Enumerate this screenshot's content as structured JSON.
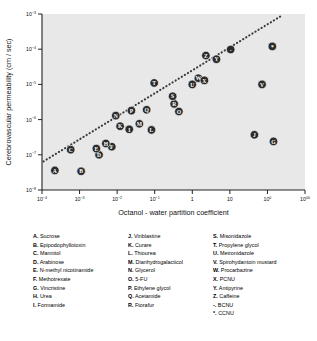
{
  "chart_data": {
    "type": "scatter",
    "title": "",
    "xlabel": "Octanol - water partition coefficient",
    "ylabel": "Cerebrovascular permeability  (cm / sec)",
    "xscale": "log",
    "yscale": "log",
    "xlim": [
      0.0001,
      1000
    ],
    "ylim": [
      1e-08,
      0.001
    ],
    "xticks": [
      "10-4",
      "10-3",
      "10-2",
      "10-1",
      "1",
      "10",
      "100",
      "1000"
    ],
    "xtick_values": [
      0.0001,
      0.001,
      0.01,
      0.1,
      1,
      10,
      100,
      1000
    ],
    "ytick_values": [
      1e-08,
      1e-07,
      1e-06,
      1e-05,
      0.0001,
      0.001
    ],
    "grid": false,
    "legend_position": "below-plot",
    "plot_bg": "#e8e8e8",
    "marker_fill": "#2b2b2b",
    "marker_label_color": "#ffffff",
    "trendline": {
      "style": "dotted",
      "color": "#3a3a3a",
      "from": [
        0.00011,
        6.5e-08
      ],
      "to": [
        260,
        0.00095
      ]
    },
    "points": [
      {
        "key": "A",
        "name": "Sucrose",
        "x": 0.00022,
        "y": 3.6e-08
      },
      {
        "key": "B",
        "name": "Epipodophyllotoxin",
        "x": 0.0011,
        "y": 3.4e-08
      },
      {
        "key": "C",
        "name": "Mannitol",
        "x": 0.00058,
        "y": 1.4e-07
      },
      {
        "key": "D",
        "name": "Arabinose",
        "x": 0.0033,
        "y": 1e-07
      },
      {
        "key": "E",
        "name": "N-methyl nicotinamide",
        "x": 0.0028,
        "y": 1.5e-07
      },
      {
        "key": "F",
        "name": "Methotrexate",
        "x": 0.0072,
        "y": 1.7e-07
      },
      {
        "key": "G",
        "name": "Vincristine",
        "x": 145,
        "y": 2.4e-07
      },
      {
        "key": "H",
        "name": "Urea",
        "x": 0.005,
        "y": 2.1e-07
      },
      {
        "key": "I",
        "name": "Formamide",
        "x": 0.021,
        "y": 5.3e-07
      },
      {
        "key": "J",
        "name": "Vinblastine",
        "x": 45,
        "y": 3.7e-07
      },
      {
        "key": "K",
        "name": "Curare",
        "x": 0.012,
        "y": 6.5e-07
      },
      {
        "key": "L",
        "name": "Thiourea",
        "x": 0.082,
        "y": 5.1e-07
      },
      {
        "key": "M",
        "name": "Dianhydrogalacticol",
        "x": 0.039,
        "y": 7.6e-07
      },
      {
        "key": "N",
        "name": "Glycerol",
        "x": 0.0092,
        "y": 1.3e-06
      },
      {
        "key": "O",
        "name": "5-FU",
        "x": 0.44,
        "y": 1.7e-06
      },
      {
        "key": "P",
        "name": "Ethylene glycol",
        "x": 0.024,
        "y": 1.8e-06
      },
      {
        "key": "Q",
        "name": "Acetamide",
        "x": 0.061,
        "y": 1.9e-06
      },
      {
        "key": "R",
        "name": "Ftorafur",
        "x": 0.33,
        "y": 2.8e-06
      },
      {
        "key": "S",
        "name": "Misonidazole",
        "x": 0.3,
        "y": 4.6e-06
      },
      {
        "key": "T",
        "name": "Propylene glycol",
        "x": 0.097,
        "y": 1.1e-05
      },
      {
        "key": "U",
        "name": "Metronidazole",
        "x": 1.0,
        "y": 1e-05
      },
      {
        "key": "V",
        "name": "Spirohydantoin mustard",
        "x": 72,
        "y": 1e-05
      },
      {
        "key": "W",
        "name": "Procarbazine",
        "x": 1.45,
        "y": 1.5e-05
      },
      {
        "key": "X",
        "name": "PCNU",
        "x": 2.1,
        "y": 1.3e-05
      },
      {
        "key": "Y",
        "name": "Antipyrine",
        "x": 4.4,
        "y": 5.2e-05
      },
      {
        "key": "Z",
        "name": "Caffeine",
        "x": 2.3,
        "y": 6.6e-05
      },
      {
        "key": "-",
        "name": "BCNU",
        "x": 10.5,
        "y": 9.8e-05
      },
      {
        "key": "*",
        "name": "CCNU",
        "x": 135,
        "y": 0.00012
      }
    ]
  },
  "legend": {
    "column1": [
      {
        "key": "A.",
        "name": "Sucrose"
      },
      {
        "key": "B.",
        "name": "Epipodophyllotoxin"
      },
      {
        "key": "C.",
        "name": "Mannitol"
      },
      {
        "key": "D.",
        "name": "Arabinose"
      },
      {
        "key": "E.",
        "name": "N-methyl nicotinamide"
      },
      {
        "key": "F.",
        "name": "Methotrexate"
      },
      {
        "key": "G.",
        "name": "Vincristine"
      },
      {
        "key": "H.",
        "name": "Urea"
      },
      {
        "key": "I.",
        "name": "Formamide"
      }
    ],
    "column2": [
      {
        "key": "J.",
        "name": "Vinblastine"
      },
      {
        "key": "K.",
        "name": "Curare"
      },
      {
        "key": "L.",
        "name": "Thiourea"
      },
      {
        "key": "M.",
        "name": "Dianhydrogalacticol"
      },
      {
        "key": "N.",
        "name": "Glycerol"
      },
      {
        "key": "O.",
        "name": "5-FU"
      },
      {
        "key": "P.",
        "name": "Ethylene glycol"
      },
      {
        "key": "Q.",
        "name": "Acetamide"
      },
      {
        "key": "R.",
        "name": "Ftorafur"
      }
    ],
    "column3": [
      {
        "key": "S.",
        "name": "Misonidazole"
      },
      {
        "key": "T.",
        "name": "Propylene glycol"
      },
      {
        "key": "U.",
        "name": "Metronidazole"
      },
      {
        "key": "V.",
        "name": "Spirohydantoin mustard"
      },
      {
        "key": "W.",
        "name": "Procarbazine"
      },
      {
        "key": "X.",
        "name": "PCNU"
      },
      {
        "key": "Y.",
        "name": "Antipyrine"
      },
      {
        "key": "Z.",
        "name": "Caffeine"
      },
      {
        "key": "-.",
        "name": "BCNU"
      },
      {
        "key": "*.",
        "name": "CCNU"
      }
    ]
  }
}
